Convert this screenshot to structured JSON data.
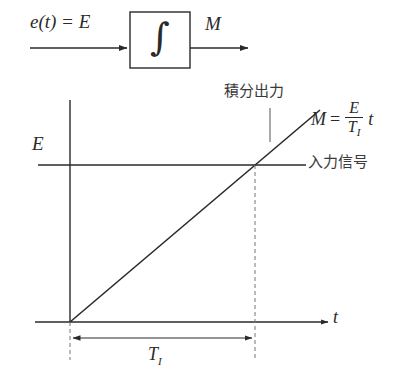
{
  "figure": {
    "background_color": "#ffffff",
    "line_color": "#2a2a2a",
    "dashed_color": "#777777"
  },
  "block_diagram": {
    "input_label": "e(t) = E",
    "input_label_parts": {
      "e": "e",
      "open_paren": "(",
      "t": "t",
      "close_paren": ")",
      "equals": "=",
      "E": "E"
    },
    "block_symbol": "∫",
    "block_symbol_name": "integral-sign",
    "output_label": "M",
    "box": {
      "x": 130,
      "y": 12,
      "width": 60,
      "height": 56
    },
    "input_arrow": {
      "x1": 30,
      "y1": 48,
      "x2": 130,
      "y2": 48
    },
    "output_arrow": {
      "x1": 190,
      "y1": 48,
      "x2": 250,
      "y2": 48
    }
  },
  "plot": {
    "axes": {
      "y_axis": {
        "x": 70,
        "y_top": 100,
        "y_bottom": 322
      },
      "t_axis": {
        "y": 322,
        "x_left": 35,
        "x_right": 330,
        "label": "t"
      }
    },
    "input_level": {
      "label": "E",
      "line_y": 165,
      "x_left": 38,
      "x_right": 306,
      "annotation": "入力信号"
    },
    "ramp": {
      "annotation": "積分出力",
      "equation_text": "M = (E/T_I) t",
      "equation_parts": {
        "M": "M",
        "equals": "=",
        "numerator": "E",
        "denominator_base": "T",
        "denominator_sub": "I",
        "variable": "t"
      },
      "start": {
        "x": 70,
        "y": 322
      },
      "crossing": {
        "x": 255,
        "y": 165
      },
      "end": {
        "x": 320,
        "y": 110
      }
    },
    "time_constant": {
      "label_base": "T",
      "label_sub": "I",
      "dimension_y": 338,
      "x_start": 70,
      "x_end": 255,
      "dashed_lines": [
        {
          "x": 70,
          "y_top": 322,
          "y_bottom": 360
        },
        {
          "x": 255,
          "y_top": 165,
          "y_bottom": 360
        }
      ]
    },
    "leader_line": {
      "x": 270,
      "y_top": 108,
      "y_bottom": 142
    }
  }
}
